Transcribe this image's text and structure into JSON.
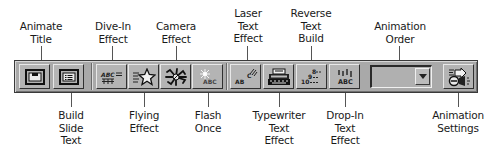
{
  "toolbar": {
    "name": "Animation Effects",
    "background": "#a9a9a9",
    "buttons": [
      {
        "id": "animate-title",
        "label": "Animate\nTitle",
        "icon": "title-slide-icon",
        "callout": "top"
      },
      {
        "id": "build-slide-text",
        "label": "Build\nSlide\nText",
        "icon": "bulleted-list-slide-icon",
        "callout": "bottom"
      },
      {
        "id": "dive-in-effect",
        "label": "Dive-In\nEffect",
        "icon": "dive-in-abc-icon",
        "callout": "top"
      },
      {
        "id": "flying-effect",
        "label": "Flying\nEffect",
        "icon": "flying-star-icon",
        "callout": "bottom"
      },
      {
        "id": "camera-effect",
        "label": "Camera\nEffect",
        "icon": "camera-shutter-icon",
        "callout": "top"
      },
      {
        "id": "flash-once",
        "label": "Flash\nOnce",
        "icon": "flash-abc-icon",
        "callout": "bottom"
      },
      {
        "id": "laser-text-effect",
        "label": "Laser\nText\nEffect",
        "icon": "laser-abc-icon",
        "callout": "top"
      },
      {
        "id": "typewriter-text-effect",
        "label": "Typewriter\nText\nEffect",
        "icon": "typewriter-icon",
        "callout": "bottom"
      },
      {
        "id": "reverse-text-build",
        "label": "Reverse\nText\nBuild",
        "icon": "reverse-order-icon",
        "callout": "top"
      },
      {
        "id": "drop-in-text-effect",
        "label": "Drop-In\nText\nEffect",
        "icon": "drop-in-abc-icon",
        "callout": "bottom"
      }
    ],
    "animation_order": {
      "label": "Animation\nOrder",
      "value": "",
      "icon": "dropdown-arrow-icon"
    },
    "animation_settings": {
      "label": "Animation\nSettings",
      "icon": "animation-settings-icon"
    }
  }
}
